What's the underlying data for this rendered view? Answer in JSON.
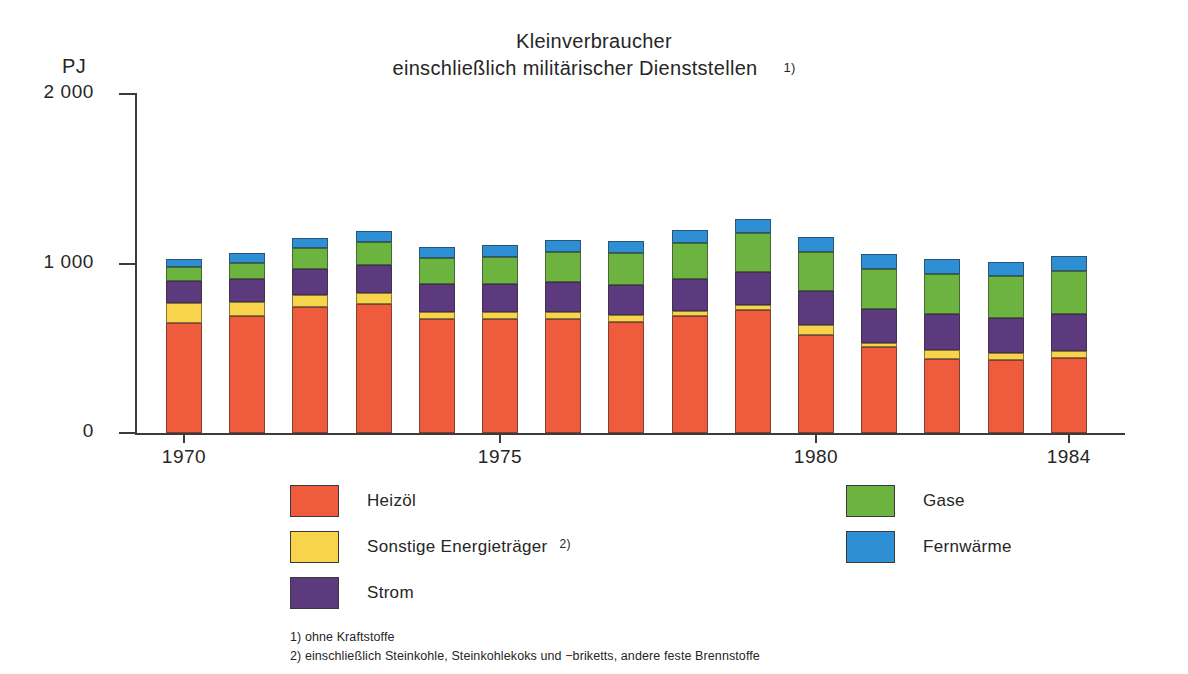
{
  "title": {
    "line1": "Kleinverbraucher",
    "line2": "einschließlich militärischer Dienststellen",
    "footnote_marker": "1)"
  },
  "axis": {
    "y_unit": "PJ",
    "y_ticks": [
      "2 000",
      "1 000",
      "0"
    ],
    "x_ticks": [
      "1970",
      "1975",
      "1980",
      "1984"
    ]
  },
  "legend": {
    "left": [
      {
        "label": "Heizöl",
        "color": "#EE5B3D",
        "footnote": ""
      },
      {
        "label": "Sonstige Energieträger",
        "color": "#F8D34C",
        "footnote": "2)"
      },
      {
        "label": "Strom",
        "color": "#5D3A7E",
        "footnote": ""
      }
    ],
    "right": [
      {
        "label": "Gase",
        "color": "#6CB33F",
        "footnote": ""
      },
      {
        "label": "Fernwärme",
        "color": "#2E8FD4",
        "footnote": ""
      }
    ]
  },
  "footnotes": [
    "1) ohne Kraftstoffe",
    "2) einschließlich Steinkohle, Steinkohlekoks und −briketts, andere feste Brennstoffe"
  ],
  "chart_data": {
    "type": "bar",
    "stacked": true,
    "xlabel": "",
    "ylabel": "PJ",
    "ylim": [
      0,
      2000
    ],
    "grid": false,
    "legend_position": "bottom",
    "categories": [
      "1970",
      "1971",
      "1972",
      "1973",
      "1974",
      "1975",
      "1976",
      "1977",
      "1978",
      "1979",
      "1980",
      "1981",
      "1982",
      "1983",
      "1984"
    ],
    "series": [
      {
        "name": "Heizöl",
        "color": "#EE5B3D",
        "values": [
          650,
          690,
          745,
          760,
          670,
          675,
          675,
          655,
          690,
          725,
          580,
          505,
          435,
          430,
          440
        ]
      },
      {
        "name": "Sonstige Energieträger",
        "color": "#F8D34C",
        "values": [
          115,
          85,
          70,
          65,
          45,
          40,
          40,
          40,
          30,
          30,
          55,
          25,
          55,
          40,
          45
        ]
      },
      {
        "name": "Strom",
        "color": "#5D3A7E",
        "values": [
          130,
          135,
          155,
          165,
          165,
          165,
          175,
          180,
          190,
          195,
          205,
          200,
          210,
          210,
          215
        ]
      },
      {
        "name": "Gase",
        "color": "#6CB33F",
        "values": [
          85,
          95,
          120,
          135,
          150,
          160,
          175,
          185,
          210,
          230,
          230,
          240,
          240,
          245,
          255
        ]
      },
      {
        "name": "Fernwärme",
        "color": "#2E8FD4",
        "values": [
          45,
          55,
          60,
          65,
          70,
          70,
          75,
          75,
          80,
          85,
          85,
          85,
          85,
          85,
          90
        ]
      }
    ]
  },
  "geometry": {
    "plot_left": 135,
    "plot_baseline": 433,
    "y_top_px": 94,
    "y_max_value": 2000,
    "bar_width": 36,
    "bar_pitch": 63.2,
    "first_bar_left": 166
  }
}
